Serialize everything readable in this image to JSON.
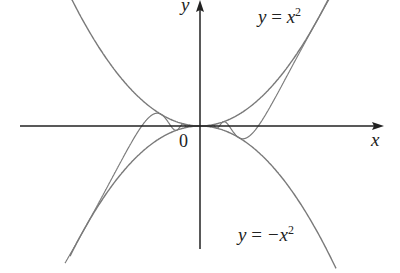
{
  "diagram": {
    "upper_curve_label": "y = x²",
    "upper_var": "y",
    "upper_rhs": "x",
    "upper_exp": "2",
    "lower_var": "y",
    "lower_rhs": "−x",
    "lower_exp": "2",
    "x_axis_label": "x",
    "y_axis_label": "y",
    "origin_label": "0",
    "colors": {
      "curve": "#777777",
      "axis": "#222222"
    }
  }
}
